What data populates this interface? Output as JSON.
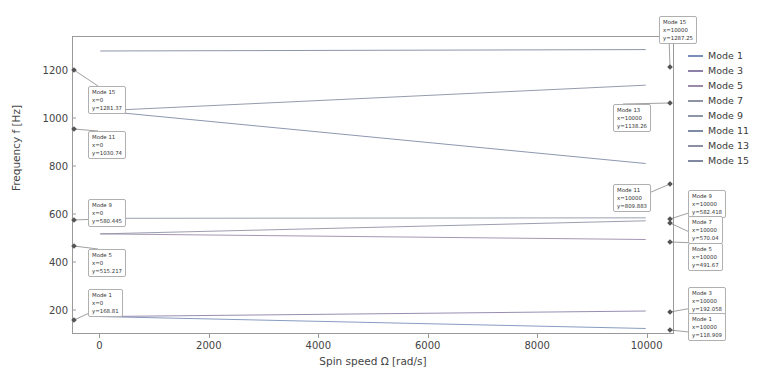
{
  "chart_data": {
    "type": "line",
    "title": "",
    "xlabel": "Spin speed Ω [rad/s]",
    "ylabel": "Frequency f [Hz]",
    "xlim": [
      -500,
      10500
    ],
    "ylim": [
      100,
      1340
    ],
    "xticks": [
      0,
      2000,
      4000,
      6000,
      8000,
      10000
    ],
    "xtick_labels": [
      "0",
      "2000",
      "4000",
      "6000",
      "8000",
      "10000"
    ],
    "yticks": [
      200,
      400,
      600,
      800,
      1000,
      1200
    ],
    "ytick_labels": [
      "200",
      "400",
      "600",
      "800",
      "1000",
      "1200"
    ],
    "grid": false,
    "legend_position": "right",
    "x": [
      0,
      10000
    ],
    "series": [
      {
        "name": "Mode 1",
        "values": [
          168.81,
          118.909
        ],
        "color": "#7a8fb8"
      },
      {
        "name": "Mode 3",
        "values": [
          168.81,
          192.058
        ],
        "color": "#8c7fa8"
      },
      {
        "name": "Mode 5",
        "values": [
          515.217,
          491.67
        ],
        "color": "#9a8aa8"
      },
      {
        "name": "Mode 7",
        "values": [
          515.217,
          570.04
        ],
        "color": "#8f93a6"
      },
      {
        "name": "Mode 9",
        "values": [
          580.445,
          582.418
        ],
        "color": "#8d96a4"
      },
      {
        "name": "Mode 11",
        "values": [
          1030.74,
          809.883
        ],
        "color": "#7e8ba5"
      },
      {
        "name": "Mode 13",
        "values": [
          1030.74,
          1138.26
        ],
        "color": "#8a8fa2"
      },
      {
        "name": "Mode 15",
        "values": [
          1281.37,
          1287.25
        ],
        "color": "#7f88a0"
      }
    ]
  },
  "legend": {
    "items": [
      {
        "label": "Mode 1"
      },
      {
        "label": "Mode 3"
      },
      {
        "label": "Mode 5"
      },
      {
        "label": "Mode 7"
      },
      {
        "label": "Mode 9"
      },
      {
        "label": "Mode 11"
      },
      {
        "label": "Mode 13"
      },
      {
        "label": "Mode 15"
      }
    ]
  },
  "datatips": [
    {
      "id": "tip-mode15-left",
      "mode": "Mode 15",
      "x": "x=0",
      "y": "y=1281.37"
    },
    {
      "id": "tip-mode11-left",
      "mode": "Mode 11",
      "x": "x=0",
      "y": "y=1030.74"
    },
    {
      "id": "tip-mode9-left",
      "mode": "Mode 9",
      "x": "x=0",
      "y": "y=580.445"
    },
    {
      "id": "tip-mode5-left",
      "mode": "Mode 5",
      "x": "x=0",
      "y": "y=515.217"
    },
    {
      "id": "tip-mode1-left",
      "mode": "Mode 1",
      "x": "x=0",
      "y": "y=168.81"
    },
    {
      "id": "tip-mode15-right",
      "mode": "Mode 15",
      "x": "x=10000",
      "y": "y=1287.25"
    },
    {
      "id": "tip-mode13-right",
      "mode": "Mode 13",
      "x": "x=10000",
      "y": "y=1138.26"
    },
    {
      "id": "tip-mode11-right",
      "mode": "Mode 11",
      "x": "x=10000",
      "y": "y=809.883"
    },
    {
      "id": "tip-mode9-right",
      "mode": "Mode 9",
      "x": "x=10000",
      "y": "y=582.418"
    },
    {
      "id": "tip-mode7-right",
      "mode": "Mode 7",
      "x": "x=10000",
      "y": "y=570.04"
    },
    {
      "id": "tip-mode5-right",
      "mode": "Mode 5",
      "x": "x=10000",
      "y": "y=491.67"
    },
    {
      "id": "tip-mode3-right",
      "mode": "Mode 3",
      "x": "x=10000",
      "y": "y=192.058"
    },
    {
      "id": "tip-mode1-right",
      "mode": "Mode 1",
      "x": "x=10000",
      "y": "y=118.909"
    }
  ]
}
